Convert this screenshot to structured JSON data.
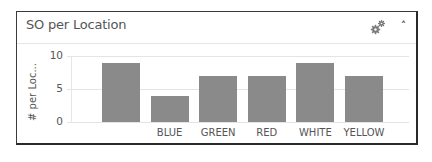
{
  "widget": {
    "title": "SO per Location",
    "icons": {
      "settings": "gear-icon",
      "collapse": "chevron-up-icon"
    },
    "collapse_glyph": "˄"
  },
  "colors": {
    "bar": "#8a8a8a",
    "grid": "#e4e4e4",
    "border": "#3a3a3a"
  },
  "chart_data": {
    "type": "bar",
    "title": "SO per Location",
    "xlabel": "",
    "ylabel": "# per Loc...",
    "categories": [
      "",
      "BLUE",
      "GREEN",
      "RED",
      "WHITE",
      "YELLOW"
    ],
    "values": [
      9,
      4,
      7,
      7,
      9,
      7
    ],
    "ylim": [
      0,
      10
    ],
    "yticks": [
      "0",
      "5",
      "10"
    ],
    "grid": true,
    "legend": "none"
  }
}
